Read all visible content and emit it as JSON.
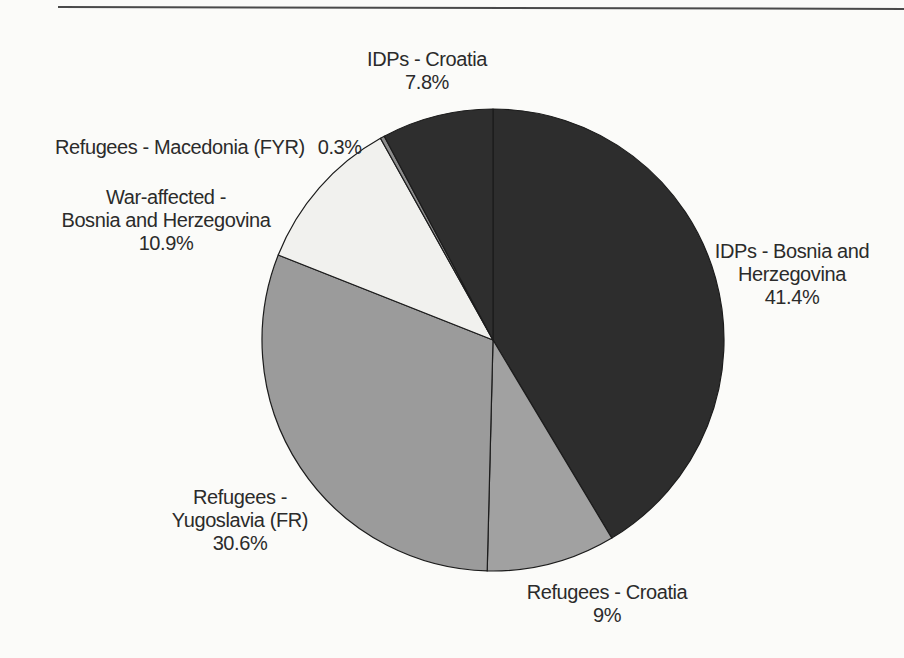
{
  "page": {
    "background_color": "#fbfbf9",
    "rule_color": "#4a4a4a"
  },
  "chart_data": {
    "type": "pie",
    "unit": "%",
    "start_angle_deg": 0,
    "direction": "clockwise",
    "stroke_color": "#1c1c1c",
    "legend_position": "none",
    "slices": [
      {
        "id": "idps-bosnia-herzegovina",
        "label": "IDPs - Bosnia and Herzegovina",
        "value": 41.4,
        "display_value": "41.4%",
        "color": "#2d2d2d",
        "annotation_lines": [
          "IDPs - Bosnia and",
          "Herzegovina",
          "41.4%"
        ]
      },
      {
        "id": "refugees-croatia",
        "label": "Refugees - Croatia",
        "value": 9,
        "display_value": "9%",
        "color": "#a1a1a1",
        "annotation_lines": [
          "Refugees - Croatia",
          "9%"
        ]
      },
      {
        "id": "refugees-yugoslavia",
        "label": "Refugees - Yugoslavia (FR)",
        "value": 30.6,
        "display_value": "30.6%",
        "color": "#9b9b9b",
        "annotation_lines": [
          "Refugees -",
          "Yugoslavia (FR)",
          "30.6%"
        ]
      },
      {
        "id": "war-affected-bosnia-herzegovina",
        "label": "War-affected - Bosnia and Herzegovina",
        "value": 10.9,
        "display_value": "10.9%",
        "color": "#f1f1ee",
        "annotation_lines": [
          "War-affected -",
          "Bosnia and Herzegovina",
          "10.9%"
        ]
      },
      {
        "id": "refugees-macedonia",
        "label": "Refugees - Macedonia (FYR)",
        "value": 0.3,
        "display_value": "0.3%",
        "color": "#8c8c8c",
        "annotation_lines": [
          "Refugees - Macedonia (FYR)",
          "0.3%"
        ]
      },
      {
        "id": "idps-croatia",
        "label": "IDPs - Croatia",
        "value": 7.8,
        "display_value": "7.8%",
        "color": "#2e2e2e",
        "annotation_lines": [
          "IDPs - Croatia",
          "7.8%"
        ]
      }
    ]
  }
}
